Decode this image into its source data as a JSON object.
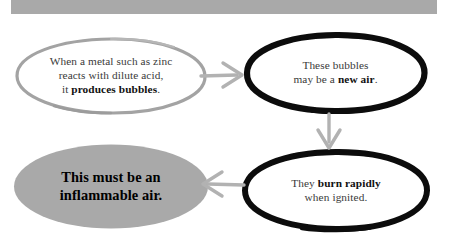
{
  "header": {
    "band_color": "#a9a9a9"
  },
  "diagram": {
    "nodes": [
      {
        "id": "premise",
        "name": "premise-node",
        "outline": "gray-hand-drawn",
        "outline_color": "#a0a0a0",
        "fill": "#ffffff",
        "lines": [
          {
            "plain": "When a metal such as zinc"
          },
          {
            "plain": "reacts with dilute acid,"
          },
          {
            "plain": "it ",
            "bold": "produces bubbles",
            "tail": "."
          }
        ]
      },
      {
        "id": "hypothesis",
        "name": "hypothesis-node",
        "outline": "black-hand-drawn",
        "outline_color": "#111111",
        "fill": "#ffffff",
        "lines": [
          {
            "plain": "These bubbles"
          },
          {
            "plain": "may be a ",
            "bold": "new air",
            "tail": "."
          }
        ]
      },
      {
        "id": "observation",
        "name": "observation-node",
        "outline": "black-hand-drawn",
        "outline_color": "#111111",
        "fill": "#ffffff",
        "lines": [
          {
            "plain": "They ",
            "bold": "burn rapidly"
          },
          {
            "plain": "when ignited."
          }
        ]
      },
      {
        "id": "conclusion",
        "name": "conclusion-node",
        "outline": "none",
        "outline_color": "#a9a9a9",
        "fill": "#a9a9a9",
        "lines": [
          {
            "plain": "This must be an"
          },
          {
            "plain": "inflammable air."
          }
        ]
      }
    ],
    "arrows": [
      {
        "id": "premise-to-hypothesis",
        "name": "arrow-right-icon",
        "direction": "right",
        "color": "#b0b0b0",
        "from": "premise",
        "to": "hypothesis"
      },
      {
        "id": "hypothesis-to-observation",
        "name": "arrow-down-icon",
        "direction": "down",
        "color": "#b0b0b0",
        "from": "hypothesis",
        "to": "observation"
      },
      {
        "id": "observation-to-conclusion",
        "name": "arrow-left-icon",
        "direction": "left",
        "color": "#b0b0b0",
        "from": "observation",
        "to": "conclusion"
      }
    ]
  },
  "text": {
    "premise_l1": "When a metal such as zinc",
    "premise_l2": "reacts with dilute acid,",
    "premise_l3_pre": "it ",
    "premise_l3_bold": "produces bubbles",
    "premise_l3_post": ".",
    "hypothesis_l1": "These bubbles",
    "hypothesis_l2_pre": "may be a ",
    "hypothesis_l2_bold": "new air",
    "hypothesis_l2_post": ".",
    "observation_l1_pre": "They ",
    "observation_l1_bold": "burn rapidly",
    "observation_l2": "when ignited.",
    "conclusion_l1": "This must be an",
    "conclusion_l2": "inflammable air."
  }
}
